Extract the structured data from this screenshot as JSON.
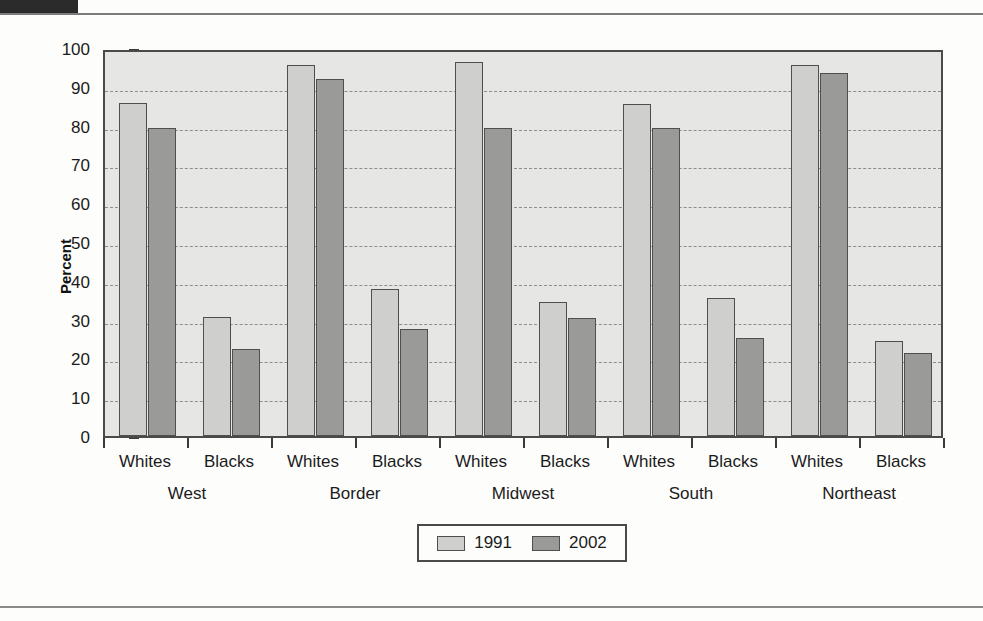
{
  "chart_data": {
    "type": "bar",
    "title": "",
    "xlabel": "",
    "ylabel": "Percent",
    "ylim": [
      0,
      100
    ],
    "ytick_step": 10,
    "yticks": [
      0,
      10,
      20,
      30,
      40,
      50,
      60,
      70,
      80,
      90,
      100
    ],
    "grid": true,
    "grid_style": "dashed-horizontal",
    "legend_position": "bottom-center",
    "groups": [
      "West",
      "Border",
      "Midwest",
      "South",
      "Northeast"
    ],
    "subgroups": [
      "Whites",
      "Blacks"
    ],
    "categories": [
      "West - Whites",
      "West - Blacks",
      "Border - Whites",
      "Border - Blacks",
      "Midwest - Whites",
      "Midwest - Blacks",
      "South - Whites",
      "South - Blacks",
      "Northeast - Whites",
      "Northeast - Blacks"
    ],
    "series": [
      {
        "name": "1991",
        "color": "#cfcfcd",
        "values": [
          85.8,
          30.8,
          95.5,
          37.8,
          96.5,
          34.5,
          85.5,
          35.5,
          95.5,
          24.5
        ]
      },
      {
        "name": "2002",
        "color": "#9a9a98",
        "values": [
          79.5,
          22.5,
          92.0,
          27.5,
          79.5,
          30.5,
          79.3,
          25.3,
          93.5,
          21.3
        ]
      }
    ]
  },
  "axis": {
    "y_title": "Percent",
    "y_tick_labels": [
      "100",
      "90",
      "80",
      "70",
      "60",
      "50",
      "40",
      "30",
      "20",
      "10",
      "0"
    ],
    "x_group_labels": [
      "West",
      "Border",
      "Midwest",
      "South",
      "Northeast"
    ],
    "x_sub_labels": [
      "Whites",
      "Blacks",
      "Whites",
      "Blacks",
      "Whites",
      "Blacks",
      "Whites",
      "Blacks",
      "Whites",
      "Blacks"
    ]
  },
  "legend": {
    "items": [
      {
        "label": "1991",
        "color": "#cfcfcd"
      },
      {
        "label": "2002",
        "color": "#9a9a98"
      }
    ]
  },
  "colors": {
    "series_1991": "#cfcfcd",
    "series_2002": "#9a9a98",
    "plot_background": "#e6e6e4",
    "frame": "#4a4a4a",
    "gridline": "#8d8d8d",
    "text": "#1b1b1b",
    "header_tab": "#2b2b2b"
  }
}
